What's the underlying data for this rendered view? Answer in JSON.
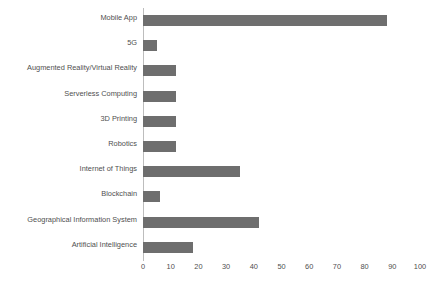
{
  "chart_data": {
    "type": "bar",
    "orientation": "horizontal",
    "title": "",
    "subtitle": "",
    "xlabel": "",
    "ylabel": "",
    "xlim": [
      0,
      100
    ],
    "xticks": [
      0,
      10,
      20,
      30,
      40,
      50,
      60,
      70,
      80,
      90,
      100
    ],
    "xtick_labels": [
      "0",
      "10",
      "20",
      "30",
      "40",
      "50",
      "60",
      "70",
      "80",
      "90",
      "100"
    ],
    "grid": false,
    "legend": false,
    "legend_position": "none",
    "bar_color": "#6e6e6e",
    "text_color": "#4f4f4f",
    "axis_color": "#bdbdbd",
    "background": "#ffffff",
    "categories": [
      "Mobile App",
      "5G",
      "Augmented Reality/Virtual Reality",
      "Serverless Computing",
      "3D Printing",
      "Robotics",
      "Internet of Things",
      "Blockchain",
      "Geographical Information System",
      "Artificial Intelligence"
    ],
    "values": [
      88,
      5,
      12,
      12,
      12,
      12,
      35,
      6,
      42,
      18
    ]
  }
}
